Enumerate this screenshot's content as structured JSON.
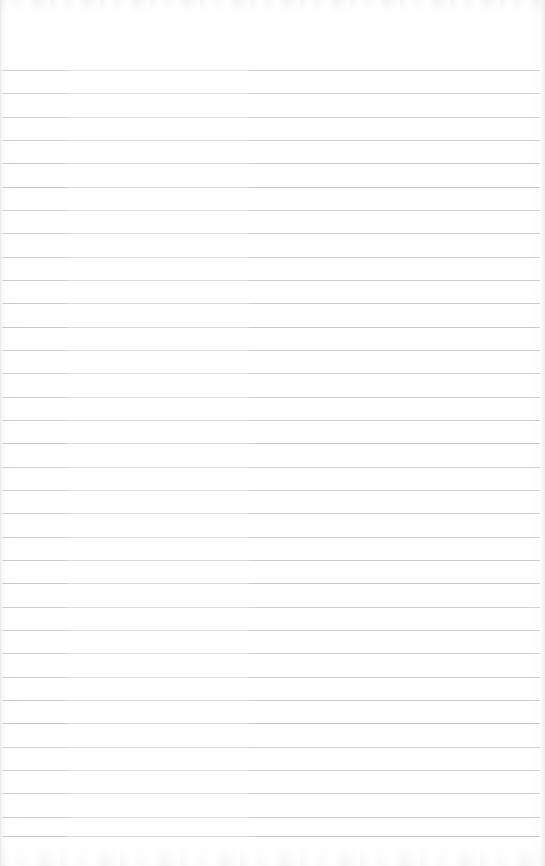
{
  "document": {
    "kind": "scanned-blank-ruled-paper",
    "title": "Blank Lined Notepad Page",
    "content_text": "",
    "has_handwriting": false,
    "has_printed_text": false,
    "page_width": 545,
    "page_height": 866
  },
  "paper": {
    "background_color": "#ffffff",
    "edge_tint_color": "#ececf0",
    "noise_band_color": "#e9e9ee"
  },
  "ruling": {
    "line_color": "#c6c6cc",
    "line_thickness": 1,
    "first_line_y": 70,
    "spacing": 23.3,
    "line_count": 34,
    "line_start_x": 2,
    "line_end_x": 540,
    "top_margin_label": "header space",
    "top_margin_height": 70,
    "lines_y": [
      70,
      93,
      117,
      140,
      163,
      187,
      210,
      233,
      257,
      280,
      303,
      327,
      350,
      373,
      397,
      420,
      443,
      467,
      490,
      513,
      537,
      560,
      583,
      607,
      630,
      653,
      677,
      700,
      723,
      747,
      770,
      793,
      817,
      836
    ]
  }
}
